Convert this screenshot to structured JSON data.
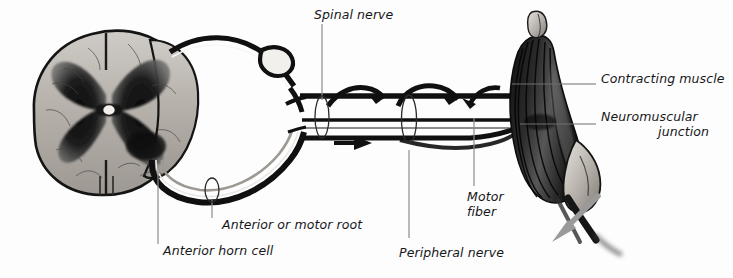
{
  "figure": {
    "background_color": "#fdfdfd",
    "ink_color": "#17171a",
    "leader_color": "#8c8c8c",
    "accent_arrow_color": "#9a9a9a",
    "width": 733,
    "height": 278
  },
  "labels": {
    "spinal_nerve": "Spinal nerve",
    "contracting_muscle": "Contracting muscle",
    "neuromuscular_junction_line1": "Neuromuscular",
    "neuromuscular_junction_line2": "junction",
    "motor_fiber_line1": "Motor",
    "motor_fiber_line2": "fiber",
    "peripheral_nerve": "Peripheral nerve",
    "anterior_or_motor_root": "Anterior or motor root",
    "anterior_horn_cell": "Anterior horn cell"
  },
  "structures": {
    "spinal_cord": "spinal-cord-cross-section",
    "gray_matter": "butterfly-gray-matter",
    "central_canal": "central-canal",
    "dorsal_root": "dorsal-root",
    "ventral_root": "ventral-root",
    "muscle": "contracting-skeletal-muscle",
    "tendon": "tendon"
  },
  "annotations": {
    "conduction_arrow": "black-arrow-right",
    "contraction_arrow": "gray-arrow-down-left"
  }
}
